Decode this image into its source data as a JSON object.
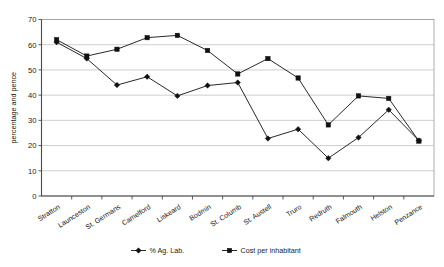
{
  "chart_data": {
    "type": "line",
    "title": "",
    "xlabel": "",
    "ylabel": "percentage and pence",
    "ylim": [
      0,
      70
    ],
    "ytick_step": 10,
    "yticks": [
      0,
      10,
      20,
      30,
      40,
      50,
      60,
      70
    ],
    "grid": true,
    "legend_position": "bottom",
    "categories": [
      "Stratton",
      "Launceston",
      "St. Germans",
      "Camelford",
      "Liskeard",
      "Bodmin",
      "St. Columb",
      "St. Austell",
      "Truro",
      "Redruth",
      "Falmouth",
      "Helston",
      "Penzance"
    ],
    "series": [
      {
        "name": "% Ag. Lab.",
        "marker": "diamond",
        "color": "#111111",
        "values": [
          61.0,
          54.5,
          44.0,
          47.3,
          39.7,
          43.8,
          45.0,
          22.8,
          26.5,
          15.0,
          23.2,
          34.2,
          22.0
        ]
      },
      {
        "name": "Cost per inhabitant",
        "marker": "square",
        "color": "#111111",
        "values": [
          62.0,
          55.5,
          58.2,
          62.8,
          63.7,
          57.7,
          48.4,
          54.5,
          46.8,
          28.2,
          39.7,
          38.7,
          21.8
        ]
      }
    ]
  },
  "axis": {
    "y_label": "percentage and pence"
  },
  "colors": {
    "ink": "#111111",
    "grid": "#b9b9b9",
    "axis": "#4a4a4a",
    "background": "#ffffff"
  }
}
